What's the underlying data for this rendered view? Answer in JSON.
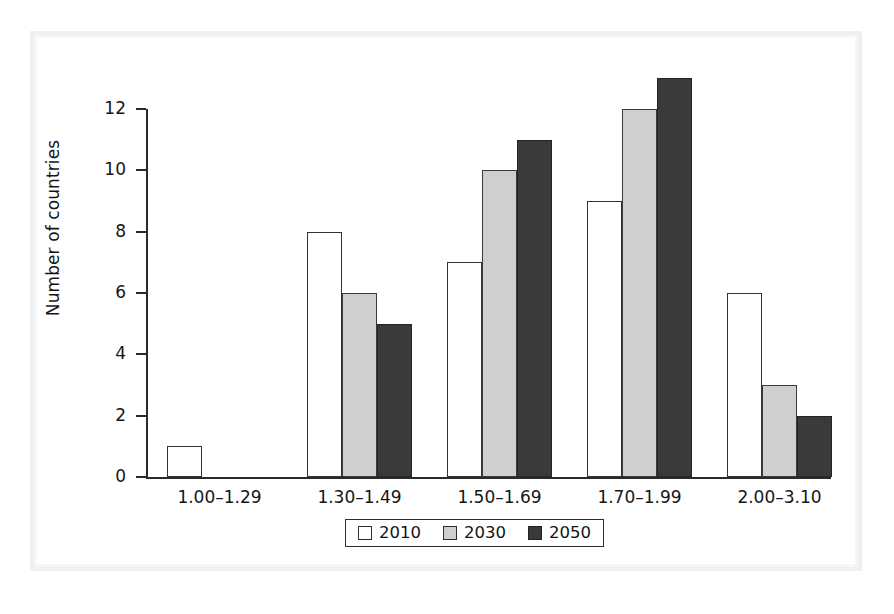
{
  "chart_data": {
    "type": "bar",
    "title": "",
    "subtitle": "",
    "xlabel": "",
    "ylabel": "Number of countries",
    "categories": [
      "1.00–1.29",
      "1.30–1.49",
      "1.50–1.69",
      "1.70–1.99",
      "2.00–3.10"
    ],
    "series": [
      {
        "name": "2010",
        "color": "#ffffff",
        "values": [
          1,
          8,
          7,
          9,
          6
        ]
      },
      {
        "name": "2030",
        "color": "#cfcfcf",
        "values": [
          0,
          6,
          10,
          12,
          3
        ]
      },
      {
        "name": "2050",
        "color": "#3a3a3a",
        "values": [
          0,
          5,
          11,
          13,
          2
        ]
      }
    ],
    "ylim": [
      0,
      13.6
    ],
    "ytick_labels": [
      "0",
      "2",
      "4",
      "6",
      "8",
      "10",
      "12"
    ],
    "ytick_values": [
      0,
      2,
      4,
      6,
      8,
      10,
      12
    ],
    "grid": false,
    "legend_position": "bottom-center",
    "annotations": []
  },
  "legend": {
    "entries": [
      {
        "label": "2010",
        "swatch": "white-square-swatch"
      },
      {
        "label": "2030",
        "swatch": "light-gray-square-swatch"
      },
      {
        "label": "2050",
        "swatch": "dark-gray-square-swatch"
      }
    ]
  },
  "colors": {
    "axis": "#2a2a2a",
    "text": "#161616",
    "series_2010": "#ffffff",
    "series_2030": "#cfcfcf",
    "series_2050": "#3a3a3a",
    "page_background": "#ffffff",
    "scan_frame": "#efefef"
  }
}
